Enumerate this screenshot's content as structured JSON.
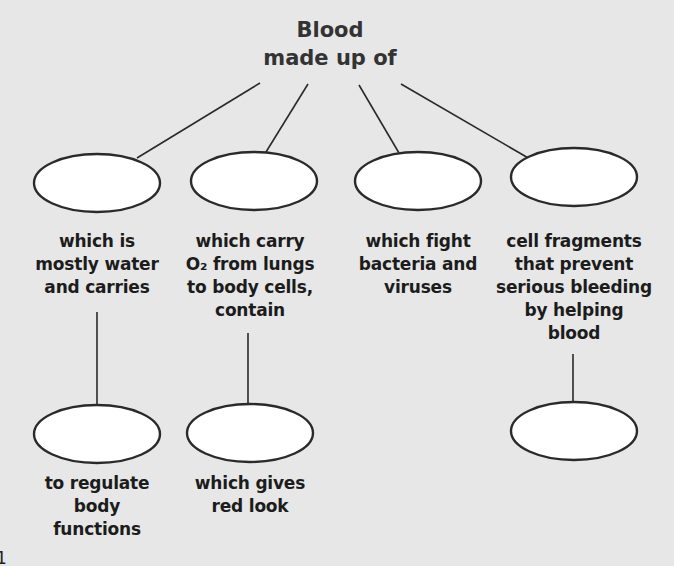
{
  "title": {
    "lines": [
      "Blood",
      "made up of"
    ]
  },
  "nodes": [
    {
      "id": "plasma",
      "blank": "",
      "description": [
        "which is",
        "mostly water",
        "and carries"
      ],
      "child": {
        "blank": "",
        "description": [
          "to regulate",
          "body",
          "functions"
        ]
      }
    },
    {
      "id": "red-blood-cells",
      "blank": "",
      "description": [
        "which carry",
        "O₂ from lungs",
        "to body cells,",
        "contain"
      ],
      "child": {
        "blank": "",
        "description": [
          "which gives",
          "red look"
        ]
      }
    },
    {
      "id": "white-blood-cells",
      "blank": "",
      "description": [
        "which fight",
        "bacteria and",
        "viruses"
      ],
      "child": null
    },
    {
      "id": "platelets",
      "blank": "",
      "description": [
        "cell fragments",
        "that prevent",
        "serious bleeding",
        "by helping",
        "blood"
      ],
      "child": {
        "blank": "",
        "description": []
      }
    }
  ],
  "page_mark": "1",
  "colors": {
    "background": "#e7e7e7",
    "ellipse_fill": "#ffffff",
    "stroke": "#2a2a2a",
    "text": "#1c1c1c"
  }
}
